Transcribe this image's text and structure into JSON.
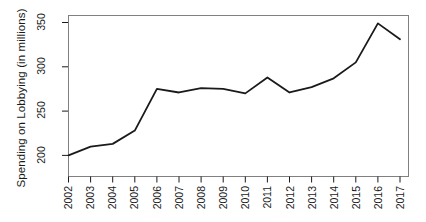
{
  "chart_data": {
    "type": "line",
    "title": "",
    "xlabel": "",
    "ylabel": "Spending on Lobbying (in millions)",
    "categories": [
      "2002",
      "2003",
      "2004",
      "2005",
      "2006",
      "2007",
      "2008",
      "2009",
      "2010",
      "2011",
      "2012",
      "2013",
      "2014",
      "2015",
      "2016",
      "2017"
    ],
    "x": [
      2002,
      2003,
      2004,
      2005,
      2006,
      2007,
      2008,
      2009,
      2010,
      2011,
      2012,
      2013,
      2014,
      2015,
      2016,
      2017
    ],
    "values": [
      200,
      210,
      213,
      228,
      275,
      271,
      276,
      275,
      270,
      288,
      271,
      277,
      287,
      305,
      349,
      331
    ],
    "series": [
      {
        "name": "Spending on Lobbying",
        "values": [
          200,
          210,
          213,
          228,
          275,
          271,
          276,
          275,
          270,
          288,
          271,
          277,
          287,
          305,
          349,
          331
        ]
      }
    ],
    "ylim": [
      195,
      355
    ],
    "xlim": [
      2002,
      2017
    ],
    "y_ticks": [
      200,
      250,
      300,
      350
    ],
    "y_tick_labels": [
      "200",
      "250",
      "300",
      "350"
    ],
    "x_ticks": [
      2002,
      2003,
      2004,
      2005,
      2006,
      2007,
      2008,
      2009,
      2010,
      2011,
      2012,
      2013,
      2014,
      2015,
      2016,
      2017
    ],
    "grid": false,
    "legend": false,
    "legend_position": "none",
    "line_color": "#1a1a1a",
    "line_width": 1.8,
    "frame_color": "#808080",
    "background_color": "#ffffff",
    "markers": false,
    "annotations": []
  },
  "axes": {
    "y_title": "Spending on Lobbying (in millions)",
    "y_labels": [
      "350",
      "300",
      "250",
      "200"
    ],
    "x_labels": [
      "2002",
      "2003",
      "2004",
      "2005",
      "2006",
      "2007",
      "2008",
      "2009",
      "2010",
      "2011",
      "2012",
      "2013",
      "2014",
      "2015",
      "2016",
      "2017"
    ]
  }
}
